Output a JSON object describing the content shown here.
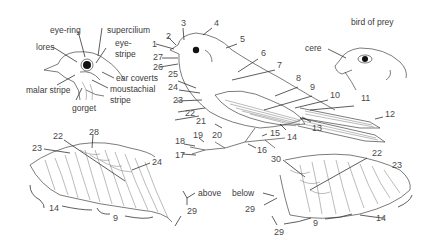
{
  "diagram": {
    "title_bird_of_prey": "bird of prey",
    "head_labels": {
      "eye_ring": "eye-ring",
      "supercilium": "supercilium",
      "lores": "lores",
      "eye_stripe_1": "eye-",
      "eye_stripe_2": "stripe",
      "ear_coverts": "ear coverts",
      "malar_stripe": "malar stripe",
      "moustachial_1": "moustachial",
      "moustachial_2": "stripe",
      "gorget": "gorget"
    },
    "raptor_labels": {
      "cere": "cere"
    },
    "wing_labels": {
      "above": "above",
      "below": "below"
    },
    "body_numbers": [
      "1",
      "2",
      "3",
      "4",
      "5",
      "6",
      "7",
      "8",
      "9",
      "10",
      "11",
      "12",
      "13",
      "14",
      "15",
      "16",
      "17",
      "18",
      "19",
      "20",
      "21",
      "22",
      "23",
      "24",
      "25",
      "26",
      "27"
    ],
    "upper_wing_numbers": {
      "n22": "22",
      "n28": "28",
      "n23": "23",
      "n24": "24",
      "n14": "14",
      "n9": "9",
      "n29": "29"
    },
    "under_wing_numbers": {
      "n30": "30",
      "n22": "22",
      "n23": "23",
      "n29a": "29",
      "n29b": "29",
      "n9": "9",
      "n14": "14"
    }
  }
}
